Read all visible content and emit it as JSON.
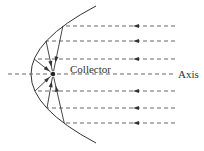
{
  "diagram": {
    "type": "parabolic-reflector",
    "labels": {
      "collector": "Collector",
      "axis": "Axis"
    },
    "incoming_ray_count": 6,
    "reflected_ray_count": 6,
    "colors": {
      "stroke": "#333333",
      "dash": "#555555",
      "background": "#ffffff"
    }
  }
}
